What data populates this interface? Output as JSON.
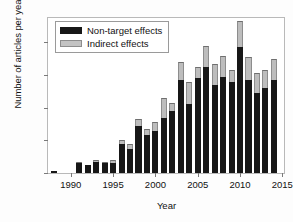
{
  "chart_data": {
    "type": "bar",
    "title": "",
    "xlabel": "Year",
    "ylabel": "Number of articles per year",
    "xlim": [
      1987.3,
      2015.2
    ],
    "ylim": [
      0,
      95
    ],
    "yticks": [
      0,
      20,
      40,
      60,
      80
    ],
    "xticks": [
      1990,
      1995,
      2000,
      2005,
      2010,
      2015
    ],
    "grid": false,
    "stacked": true,
    "legend_position": "top-left",
    "colors": {
      "non_target": "#171717",
      "indirect": "#bdbdbd"
    },
    "categories": [
      1988,
      1989,
      1990,
      1991,
      1992,
      1993,
      1994,
      1995,
      1996,
      1997,
      1998,
      1999,
      2000,
      2001,
      2002,
      2003,
      2004,
      2005,
      2006,
      2007,
      2008,
      2009,
      2010,
      2011,
      2012,
      2013,
      2014
    ],
    "series": [
      {
        "name": "Non-target effects",
        "values": [
          1,
          0,
          0,
          6,
          5,
          7,
          6,
          6,
          18,
          15,
          29,
          23,
          26,
          34,
          38,
          57,
          42,
          58,
          65,
          54,
          59,
          56,
          77,
          57,
          49,
          52,
          57
        ]
      },
      {
        "name": "Indirect effects",
        "values": [
          0,
          0,
          0,
          1,
          0,
          1,
          1,
          2,
          2,
          3,
          4,
          4,
          5,
          12,
          5,
          11,
          14,
          7,
          13,
          13,
          13,
          7,
          16,
          14,
          12,
          11,
          13
        ]
      }
    ],
    "totals": [
      1,
      0,
      0,
      7,
      5,
      8,
      7,
      8,
      20,
      18,
      33,
      27,
      31,
      46,
      43,
      68,
      56,
      65,
      78,
      67,
      72,
      63,
      93,
      71,
      61,
      63,
      70
    ]
  },
  "legend": {
    "entries": [
      {
        "label": "Non-target effects",
        "swatch": "black"
      },
      {
        "label": "Indirect effects",
        "swatch": "gray"
      }
    ]
  }
}
